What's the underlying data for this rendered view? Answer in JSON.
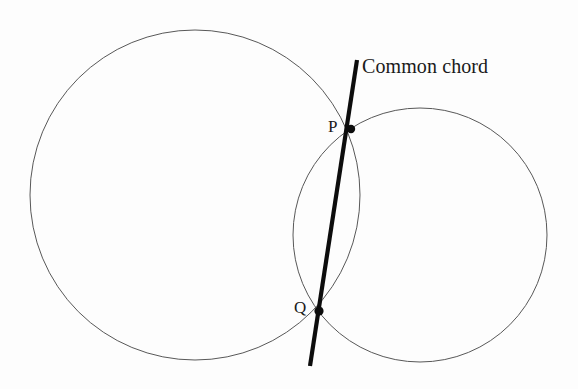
{
  "figure": {
    "title": "",
    "background_color": "#fdfdfd",
    "width": 578,
    "height": 389
  },
  "labels": {
    "common_chord": "Common chord",
    "point_p": "P",
    "point_q": "Q"
  },
  "geometry": {
    "stroke_circle_color": "#585858",
    "stroke_chord_color": "#0d0d0d",
    "circle_stroke_width": 1,
    "chord_stroke_width": 4.2,
    "circles": [
      {
        "name": "left-circle",
        "cx": 195,
        "cy": 195,
        "r": 165
      },
      {
        "name": "right-circle",
        "cx": 420,
        "cy": 235,
        "r": 127
      }
    ],
    "chord": {
      "name": "common-chord",
      "x1": 357,
      "y1": 60,
      "x2": 310,
      "y2": 366
    },
    "points": [
      {
        "name": "intersection-point-p",
        "label": "P",
        "cx": 351,
        "cy": 129,
        "r": 4.2
      },
      {
        "name": "intersection-point-q",
        "label": "Q",
        "cx": 319,
        "cy": 311,
        "r": 4.6
      }
    ]
  }
}
